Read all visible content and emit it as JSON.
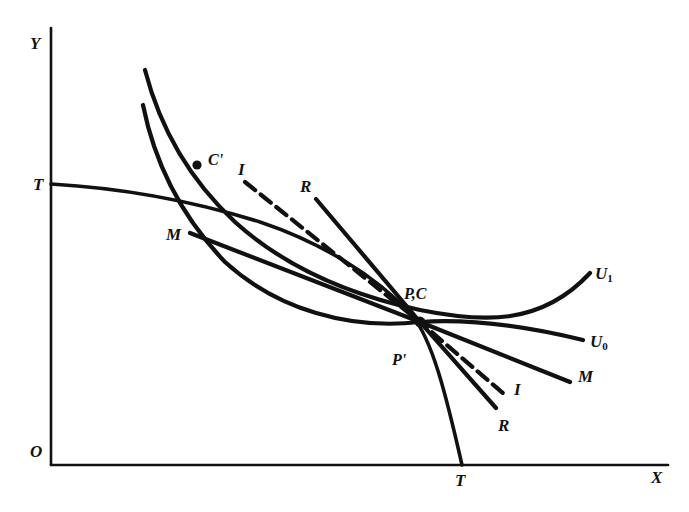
{
  "figure": {
    "type": "economic-diagram",
    "background_color": "#ffffff",
    "ink_color": "#111111"
  },
  "axes": {
    "y_label": "Y",
    "x_label": "X",
    "origin_label": "O",
    "y_axis": {
      "x": 51,
      "y_top": 28,
      "y_bottom": 465
    },
    "x_axis": {
      "y": 465,
      "x_left": 51,
      "x_right": 668
    }
  },
  "curves": [
    {
      "id": "u1",
      "label": "U",
      "subscript": "1",
      "kind": "indifference-curve",
      "style": "solid",
      "stroke_width": 4.2,
      "label_pos": {
        "x": 595,
        "y": 265
      },
      "path": "M145,70 C160,128 190,180 235,222 C286,268 350,295 420,310 C480,322 540,327 590,273"
    },
    {
      "id": "u0",
      "label": "U",
      "subscript": "0",
      "kind": "indifference-curve",
      "style": "solid",
      "stroke_width": 4.2,
      "label_pos": {
        "x": 590,
        "y": 333
      },
      "path": "M143,105 C154,160 180,215 225,262 C278,310 350,330 420,322 C480,318 542,330 583,340"
    },
    {
      "id": "tt",
      "label": "T",
      "kind": "transformation-curve",
      "style": "solid",
      "stroke_width": 3.6,
      "label_start_pos": {
        "x": 33,
        "y": 176
      },
      "label_end_pos": {
        "x": 455,
        "y": 472
      },
      "path": "M51,184 C120,188 190,200 260,222 C320,242 375,275 412,315 C432,340 445,390 462,465"
    }
  ],
  "price_lines": [
    {
      "id": "mm",
      "label": "M",
      "kind": "price-line-domestic",
      "style": "solid",
      "stroke_width": 4.2,
      "label_start_pos": {
        "x": 166,
        "y": 226
      },
      "label_end_pos": {
        "x": 578,
        "y": 368
      },
      "path": "M190,233 L420,322 L570,382"
    },
    {
      "id": "rr",
      "label": "R",
      "kind": "price-line-world",
      "style": "solid",
      "stroke_width": 4.2,
      "label_start_pos": {
        "x": 300,
        "y": 178
      },
      "label_end_pos": {
        "x": 498,
        "y": 417
      },
      "path": "M316,199 L420,322 L496,408"
    },
    {
      "id": "ii",
      "label": "I",
      "kind": "price-line-international",
      "style": "dashed",
      "stroke_width": 4.2,
      "dash_pattern": "13,7",
      "label_start_pos": {
        "x": 238,
        "y": 161
      },
      "label_end_pos": {
        "x": 514,
        "y": 381
      },
      "path": "M245,182 L420,322 L504,394"
    }
  ],
  "points": [
    {
      "id": "c-prime",
      "label": "C'",
      "marker": {
        "x": 197,
        "y": 165
      },
      "label_pos": {
        "x": 208,
        "y": 152
      },
      "has_dot": true
    },
    {
      "id": "pc",
      "label": "P,C",
      "marker": {
        "x": 420,
        "y": 322
      },
      "label_pos": {
        "x": 404,
        "y": 286
      },
      "has_dot": false
    },
    {
      "id": "p-prime",
      "label": "P'",
      "marker": {
        "x": 412,
        "y": 345
      },
      "label_pos": {
        "x": 392,
        "y": 352
      },
      "has_dot": false
    }
  ]
}
